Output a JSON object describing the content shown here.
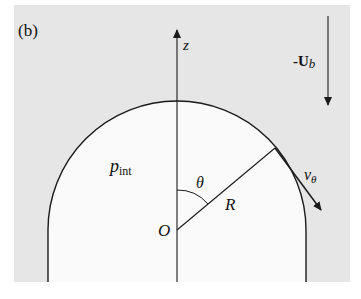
{
  "panel_label": "(b)",
  "labels": {
    "z_axis": "z",
    "flow": "-U",
    "flow_sub": "b",
    "pressure": "p",
    "pressure_sub": "int",
    "angle": "θ",
    "radius": "R",
    "origin": "O",
    "velocity": "v",
    "velocity_sub": "θ"
  },
  "colors": {
    "background_fluid": "#e6e6e6",
    "bubble_interior": "#fafafa",
    "stroke": "#1a1a1a"
  }
}
